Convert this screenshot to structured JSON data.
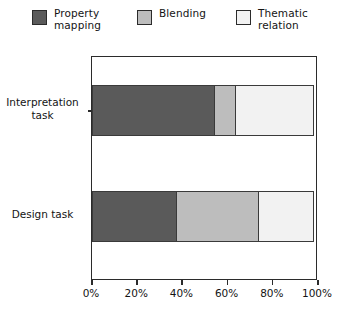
{
  "chart_data": {
    "type": "bar",
    "orientation": "horizontal",
    "stacked": true,
    "title": "",
    "xlabel": "",
    "ylabel": "",
    "categories": [
      "Interpretation\ntask",
      "Design task"
    ],
    "series": [
      {
        "name": "Property\nmapping",
        "legend_label": "Property\nmapping",
        "color": "#5a5a5a",
        "values": [
          55,
          38
        ]
      },
      {
        "name": "Blending",
        "legend_label": "Blending",
        "color": "#bdbdbd",
        "values": [
          10,
          37
        ]
      },
      {
        "name": "Thematic\nrelation",
        "legend_label": "Thematic\nrelation",
        "color": "#f2f2f2",
        "values": [
          35,
          25
        ]
      }
    ],
    "xlim": [
      0,
      100
    ],
    "xtick_values": [
      0,
      20,
      40,
      60,
      80,
      100
    ],
    "xtick_labels": [
      "0%",
      "20%",
      "40%",
      "60%",
      "80%",
      "100%"
    ],
    "grid": false,
    "legend_position": "top",
    "border_color": "#2b2b2b",
    "background": "#ffffff"
  },
  "legend": {
    "entries": [
      {
        "label": "Property\nmapping",
        "swatch": "legend-swatch-property-mapping"
      },
      {
        "label": "Blending",
        "swatch": "legend-swatch-blending"
      },
      {
        "label": "Thematic\nrelation",
        "swatch": "legend-swatch-thematic-relation"
      }
    ]
  },
  "y_axis": {
    "labels": [
      "Interpretation\ntask",
      "Design task"
    ]
  },
  "x_axis": {
    "labels": [
      "0%",
      "20%",
      "40%",
      "60%",
      "80%",
      "100%"
    ]
  }
}
